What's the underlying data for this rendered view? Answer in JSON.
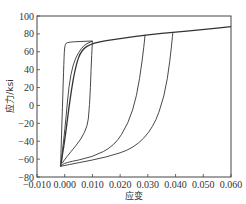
{
  "chart_data": {
    "type": "line",
    "title": "",
    "xlabel": "应变",
    "ylabel": "应力/ksi",
    "xlim": [
      -0.01,
      0.06
    ],
    "ylim": [
      -80,
      100
    ],
    "xticks": [
      "-0.010",
      "0.000",
      "0.010",
      "0.020",
      "0.030",
      "0.040",
      "0.050",
      "0.060"
    ],
    "yticks": [
      "-80",
      "-60",
      "-40",
      "-20",
      "0",
      "20",
      "40",
      "60",
      "80",
      "100"
    ],
    "grid": false,
    "legend": null,
    "series": [
      {
        "name": "monotonic envelope",
        "x": [
          -0.0015,
          0.0,
          0.002,
          0.004,
          0.006,
          0.01,
          0.02,
          0.03,
          0.04,
          0.05,
          0.06
        ],
        "y": [
          -68,
          -40,
          10,
          45,
          62,
          70,
          75,
          79,
          82,
          85,
          88
        ]
      },
      {
        "name": "cycle 1 (unload at 0.010)",
        "x": [
          0.01,
          0.0095,
          0.009,
          0.008,
          0.0,
          -0.0015,
          0.0,
          0.002,
          0.006,
          0.01
        ],
        "y": [
          72,
          40,
          0,
          -30,
          -60,
          -68,
          -30,
          40,
          66,
          72
        ]
      },
      {
        "name": "cycle 2 (unload at 0.029)",
        "x": [
          0.029,
          0.028,
          0.026,
          0.023,
          0.018,
          0.01,
          0.0,
          -0.0015
        ],
        "y": [
          79,
          50,
          10,
          -20,
          -45,
          -58,
          -64,
          -68
        ]
      },
      {
        "name": "cycle 3 (unload at 0.039)",
        "x": [
          0.039,
          0.038,
          0.036,
          0.032,
          0.025,
          0.015,
          0.005,
          -0.0015
        ],
        "y": [
          81,
          50,
          10,
          -25,
          -48,
          -58,
          -64,
          -68
        ]
      },
      {
        "name": "sharp cycle",
        "x": [
          -0.0015,
          -0.0008,
          -0.0003,
          0.0,
          0.001,
          0.01
        ],
        "y": [
          -68,
          0,
          50,
          68,
          71,
          72
        ]
      }
    ]
  }
}
